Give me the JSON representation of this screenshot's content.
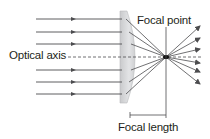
{
  "diagram": {
    "labels": {
      "focal_point": "Focal point",
      "optical_axis": "Optical axis",
      "focal_length": "Focal length"
    },
    "colors": {
      "ray": "#4d4d4f",
      "lens_fill": "#d4d5d7",
      "lens_edge": "#b9babc",
      "text": "#231f20"
    }
  }
}
